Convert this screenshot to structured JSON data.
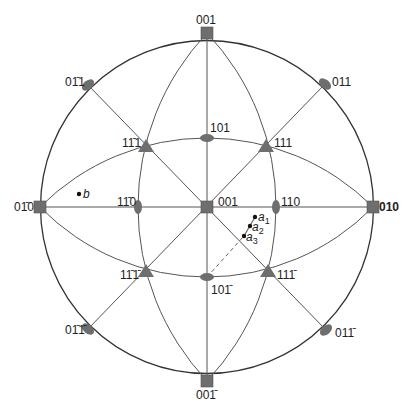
{
  "diagram": {
    "type": "stereographic-projection",
    "colors": {
      "line": "#555555",
      "marker": "#6e6e6e",
      "outer": "#333333",
      "dash": "#666666"
    },
    "center": [
      207,
      207
    ],
    "radius": 166.5,
    "poles": [
      {
        "id": "p-001-top",
        "shape": "square",
        "x": 207,
        "y": 33,
        "label": "001",
        "lx": 196,
        "ly": 14
      },
      {
        "id": "p-00-1-bottom",
        "shape": "square",
        "x": 207,
        "y": 381,
        "label": "001̄",
        "lx": 196,
        "ly": 389
      },
      {
        "id": "p-0-10",
        "shape": "square",
        "x": 40,
        "y": 207,
        "label": "01̄0",
        "lx": 14,
        "ly": 201
      },
      {
        "id": "p-010",
        "shape": "square",
        "x": 373,
        "y": 207,
        "label": "010",
        "lx": 379,
        "ly": 201,
        "bold": true
      },
      {
        "id": "p-001-center",
        "shape": "square",
        "x": 207,
        "y": 207,
        "label": "001",
        "lx": 218,
        "ly": 196
      },
      {
        "id": "p-0-11",
        "shape": "ellipse",
        "x": 88,
        "y": 85,
        "angle": -40,
        "label": "01̄1",
        "lx": 65,
        "ly": 76
      },
      {
        "id": "p-011",
        "shape": "ellipse",
        "x": 325,
        "y": 84,
        "angle": 40,
        "label": "011",
        "lx": 332,
        "ly": 76
      },
      {
        "id": "p-0-1-1",
        "shape": "ellipse",
        "x": 88,
        "y": 329,
        "angle": 40,
        "label": "01̄1̄",
        "lx": 65,
        "ly": 324
      },
      {
        "id": "p-01-1",
        "shape": "ellipse",
        "x": 326,
        "y": 330,
        "angle": -40,
        "label": "011̄",
        "lx": 335,
        "ly": 327
      },
      {
        "id": "p-101",
        "shape": "ellipse",
        "x": 207,
        "y": 138,
        "angle": 0,
        "horiz": true,
        "label": "101",
        "lx": 210,
        "ly": 122
      },
      {
        "id": "p-10-1",
        "shape": "ellipse",
        "x": 207,
        "y": 277,
        "angle": 0,
        "horiz": true,
        "label": "101̄",
        "lx": 211,
        "ly": 284
      },
      {
        "id": "p-1-10",
        "shape": "ellipse",
        "x": 138,
        "y": 207,
        "angle": 0,
        "horiz": false,
        "label": "11̄0",
        "lx": 117,
        "ly": 196
      },
      {
        "id": "p-110",
        "shape": "ellipse",
        "x": 276,
        "y": 207,
        "angle": 0,
        "horiz": false,
        "label": "110",
        "lx": 281,
        "ly": 196
      },
      {
        "id": "p-1-11",
        "shape": "triangle",
        "x": 146,
        "y": 146,
        "label": "11̄1",
        "lx": 122,
        "ly": 137
      },
      {
        "id": "p-111",
        "shape": "triangle",
        "x": 266,
        "y": 146,
        "label": "111",
        "lx": 274,
        "ly": 137
      },
      {
        "id": "p-1-1-1",
        "shape": "triangle",
        "x": 146,
        "y": 271,
        "label": "11̄1̄",
        "lx": 120,
        "ly": 269
      },
      {
        "id": "p-11-1",
        "shape": "triangle",
        "x": 268,
        "y": 271,
        "label": "111̄",
        "lx": 277,
        "ly": 269
      }
    ],
    "points": [
      {
        "id": "b",
        "x": 79,
        "y": 194,
        "label": "b",
        "lx": 83,
        "ly": 188
      },
      {
        "id": "a1",
        "x": 255,
        "y": 217,
        "label": "a",
        "sub": "1",
        "lx": 258,
        "ly": 211
      },
      {
        "id": "a2",
        "x": 250,
        "y": 226,
        "label": "a",
        "sub": "2",
        "lx": 252,
        "ly": 221
      },
      {
        "id": "a3",
        "x": 244,
        "y": 236,
        "label": "a",
        "sub": "3",
        "lx": 246,
        "ly": 231
      }
    ],
    "dashed_line": {
      "from": [
        207,
        277
      ],
      "to": [
        244,
        236
      ]
    }
  }
}
